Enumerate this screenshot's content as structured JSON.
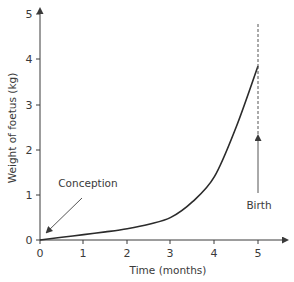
{
  "chart_data": {
    "type": "line",
    "title": "",
    "xlabel": "Time (months)",
    "ylabel": "Weight of foetus (kg)",
    "xlim": [
      0,
      5.6
    ],
    "ylim": [
      0,
      5.3
    ],
    "x_ticks": [
      "0",
      "1",
      "2",
      "3",
      "4",
      "5"
    ],
    "y_ticks": [
      "0",
      "1",
      "2",
      "3",
      "4",
      "5"
    ],
    "grid": false,
    "legend": null,
    "series": [
      {
        "name": "Foetal weight",
        "x": [
          0,
          0.5,
          1,
          1.5,
          2,
          2.5,
          3,
          3.5,
          4,
          4.5,
          5
        ],
        "values": [
          0,
          0.06,
          0.12,
          0.18,
          0.25,
          0.35,
          0.5,
          0.85,
          1.4,
          2.5,
          3.85
        ]
      }
    ],
    "annotations": [
      {
        "text": "Conception",
        "points_to": [
          0,
          0
        ]
      },
      {
        "text": "Birth",
        "x": 5,
        "marker": "dashed vertical line"
      }
    ]
  },
  "labels": {
    "xlabel": "Time (months)",
    "ylabel": "Weight of foetus (kg)",
    "conception": "Conception",
    "birth": "Birth",
    "x_ticks": [
      "0",
      "1",
      "2",
      "3",
      "4",
      "5"
    ],
    "y_ticks": [
      "0",
      "1",
      "2",
      "3",
      "4",
      "5"
    ]
  },
  "colors": {
    "axis": "#3a3a3a",
    "curve": "#2b2b2b",
    "text": "#3a3a3a",
    "annotation": "#555555"
  }
}
